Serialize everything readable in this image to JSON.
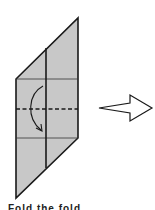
{
  "diagram": {
    "paper_color": "#c8c8c8",
    "line_color": "#1a1a1a",
    "paper": {
      "shape": "parallelogram",
      "points": [
        [
          78,
          18
        ],
        [
          78,
          138
        ],
        [
          16,
          198
        ],
        [
          16,
          79
        ]
      ]
    },
    "crease_vertical": {
      "x": 46,
      "y1": 50,
      "y2": 168
    },
    "crease_horizontal_top": {
      "y": 79
    },
    "fold_line_dashed": {
      "y": 109,
      "style": "valley-fold"
    },
    "crease_horizontal_bottom": {
      "y": 138
    },
    "fold_arrow": {
      "icon": "curved-arrow-down",
      "from": [
        43,
        86
      ],
      "to": [
        43,
        131
      ]
    },
    "next_step_arrow": {
      "icon": "outline-arrow-right"
    }
  },
  "caption": {
    "text": "Fold the fold..."
  }
}
